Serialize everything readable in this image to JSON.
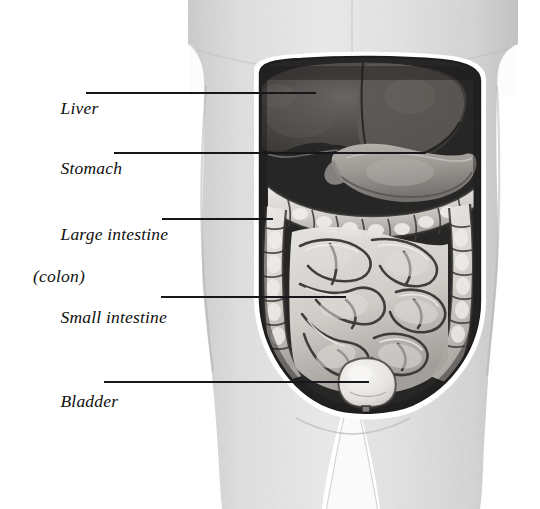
{
  "figure": {
    "background_color": "#ffffff",
    "skin_color": "#dcdcdc",
    "cavity_dark_color": "#2f2d2b",
    "organ_light_color": "#e8e6e2",
    "liver_color": "#4a4744",
    "leader_line_color": "#17161a"
  },
  "labels": [
    {
      "id": "liver",
      "text": "Liver",
      "text_line2": "",
      "x": 33,
      "y": 77,
      "leader": {
        "x1": 86,
        "y1": 93,
        "x2": 316,
        "y2": 93
      }
    },
    {
      "id": "stomach",
      "text": "Stomach",
      "text_line2": "",
      "x": 33,
      "y": 137,
      "leader": {
        "x1": 114,
        "y1": 153,
        "x2": 426,
        "y2": 153
      }
    },
    {
      "id": "large-intestine",
      "text": "Large intestine",
      "text_line2": "(colon)",
      "x": 33,
      "y": 203,
      "leader": {
        "x1": 162,
        "y1": 219,
        "x2": 273,
        "y2": 219
      }
    },
    {
      "id": "small-intestine",
      "text": "Small intestine",
      "text_line2": "",
      "x": 33,
      "y": 286,
      "leader": {
        "x1": 161,
        "y1": 297,
        "x2": 346,
        "y2": 297
      }
    },
    {
      "id": "bladder",
      "text": "Bladder",
      "text_line2": "",
      "x": 33,
      "y": 370,
      "leader": {
        "x1": 104,
        "y1": 382,
        "x2": 369,
        "y2": 382
      }
    }
  ]
}
